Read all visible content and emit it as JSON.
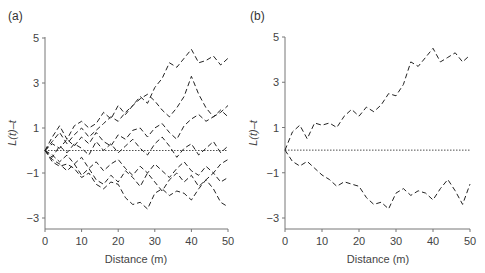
{
  "chart_data": [
    {
      "panel_label": "(a)",
      "type": "line",
      "title": "",
      "xlabel": "Distance (m)",
      "ylabel": "L(t)–t",
      "xlim": [
        0,
        50
      ],
      "ylim": [
        -3.5,
        5
      ],
      "xticks": [
        0,
        10,
        20,
        30,
        40,
        50
      ],
      "yticks": [
        -3,
        -1,
        1,
        3,
        5
      ],
      "ytick_labels": [
        "−3",
        "−1",
        "1",
        "3",
        "5"
      ],
      "grid": false,
      "legend": null,
      "reference_line": {
        "y": 0,
        "style": "dotted"
      },
      "x": [
        0,
        2,
        4,
        6,
        8,
        10,
        12,
        14,
        16,
        18,
        20,
        22,
        24,
        26,
        28,
        30,
        32,
        34,
        36,
        38,
        40,
        42,
        44,
        46,
        48,
        50
      ],
      "series": [
        {
          "name": "s1",
          "style": "dashed",
          "values": [
            0,
            0.6,
            1.1,
            0.5,
            1.1,
            1.3,
            1.0,
            1.2,
            1.7,
            1.4,
            2.0,
            1.6,
            2.0,
            2.4,
            2.1,
            2.8,
            3.2,
            3.9,
            3.7,
            4.1,
            4.5,
            3.9,
            4.0,
            4.2,
            3.8,
            4.1
          ]
        },
        {
          "name": "s2",
          "style": "dashed",
          "values": [
            0,
            0.4,
            0.8,
            0.3,
            0.7,
            1.0,
            0.6,
            0.9,
            1.2,
            1.5,
            1.3,
            1.7,
            2.0,
            2.3,
            2.5,
            2.2,
            1.8,
            1.5,
            1.9,
            2.4,
            3.3,
            2.5,
            1.9,
            1.5,
            1.7,
            2.0
          ]
        },
        {
          "name": "s3",
          "style": "dashed",
          "values": [
            0,
            0.3,
            0.1,
            0.5,
            0.2,
            0.6,
            0.3,
            0.8,
            0.4,
            0.2,
            0.7,
            0.5,
            0.9,
            1.0,
            0.6,
            1.0,
            1.2,
            0.8,
            0.5,
            1.1,
            1.4,
            1.6,
            1.3,
            1.5,
            1.8,
            1.5
          ]
        },
        {
          "name": "s4",
          "style": "dashed",
          "values": [
            0,
            -0.3,
            0.2,
            -0.1,
            0.3,
            0.1,
            -0.2,
            0.4,
            0.0,
            0.3,
            -0.1,
            0.2,
            0.5,
            0.1,
            -0.2,
            0.3,
            0.6,
            0.2,
            -0.3,
            0.1,
            0.3,
            -0.2,
            0.1,
            0.4,
            -0.1,
            0.2
          ]
        },
        {
          "name": "s5",
          "style": "dashed",
          "values": [
            0,
            -0.2,
            -0.5,
            -0.2,
            -0.6,
            -0.3,
            -0.8,
            -0.5,
            -0.9,
            -0.6,
            -0.4,
            -0.8,
            -1.1,
            -0.7,
            -1.0,
            -0.6,
            -0.9,
            -1.2,
            -0.8,
            -0.5,
            -0.9,
            -1.1,
            -0.7,
            -1.0,
            -0.6,
            -0.4
          ]
        },
        {
          "name": "s6",
          "style": "dashed",
          "values": [
            0,
            -0.4,
            -0.6,
            -0.9,
            -0.6,
            -1.1,
            -0.8,
            -1.3,
            -1.5,
            -1.1,
            -1.4,
            -0.9,
            -1.2,
            -1.6,
            -1.0,
            -1.4,
            -1.8,
            -1.3,
            -1.0,
            -1.4,
            -1.1,
            -1.6,
            -1.3,
            -1.0,
            -1.4,
            -1.2
          ]
        },
        {
          "name": "s7",
          "style": "dashed",
          "values": [
            0,
            -0.5,
            -0.7,
            -0.6,
            -0.8,
            -1.2,
            -1.0,
            -1.5,
            -1.7,
            -1.4,
            -1.5,
            -2.1,
            -2.4,
            -2.3,
            -2.6,
            -1.9,
            -1.7,
            -2.0,
            -1.8,
            -1.9,
            -2.2,
            -1.7,
            -1.3,
            -1.7,
            -2.3,
            -2.5
          ]
        }
      ]
    },
    {
      "panel_label": "(b)",
      "type": "line",
      "title": "",
      "xlabel": "Distance (m)",
      "ylabel": "L(t)–t",
      "xlim": [
        0,
        50
      ],
      "ylim": [
        -3.5,
        5
      ],
      "xticks": [
        0,
        10,
        20,
        30,
        40,
        50
      ],
      "yticks": [
        -3,
        -1,
        1,
        3,
        5
      ],
      "ytick_labels": [
        "−3",
        "−1",
        "1",
        "3",
        "5"
      ],
      "grid": false,
      "legend": null,
      "reference_line": {
        "y": 0,
        "style": "dotted"
      },
      "x": [
        0,
        2,
        4,
        6,
        8,
        10,
        12,
        14,
        16,
        18,
        20,
        22,
        24,
        26,
        28,
        30,
        32,
        34,
        36,
        38,
        40,
        42,
        44,
        46,
        48,
        50
      ],
      "series": [
        {
          "name": "upper",
          "style": "dashed",
          "values": [
            0,
            0.8,
            1.1,
            0.5,
            1.2,
            1.1,
            1.2,
            1.0,
            1.5,
            1.8,
            1.5,
            1.9,
            1.7,
            2.0,
            2.5,
            2.4,
            2.9,
            3.9,
            3.7,
            4.1,
            4.5,
            3.9,
            4.1,
            4.3,
            3.9,
            4.2
          ]
        },
        {
          "name": "lower",
          "style": "dashed",
          "values": [
            0,
            -0.5,
            -0.7,
            -0.5,
            -0.8,
            -1.1,
            -1.3,
            -1.6,
            -1.4,
            -1.5,
            -1.6,
            -2.1,
            -2.4,
            -2.3,
            -2.6,
            -1.9,
            -1.7,
            -2.0,
            -1.8,
            -1.9,
            -2.2,
            -1.7,
            -1.3,
            -1.8,
            -2.4,
            -1.5
          ]
        }
      ]
    }
  ],
  "panels": [
    {
      "label": "(a)",
      "xlabel": "Distance (m)",
      "ylabel": "L(t)–t",
      "xticks": [
        "0",
        "10",
        "20",
        "30",
        "40",
        "50"
      ],
      "yticks": [
        "5",
        "3",
        "1",
        "−1",
        "−3"
      ]
    },
    {
      "label": "(b)",
      "xlabel": "Distance (m)",
      "ylabel": "L(t)–t",
      "xticks": [
        "0",
        "10",
        "20",
        "30",
        "40",
        "50"
      ],
      "yticks": [
        "5",
        "3",
        "1",
        "−1",
        "−3"
      ]
    }
  ]
}
